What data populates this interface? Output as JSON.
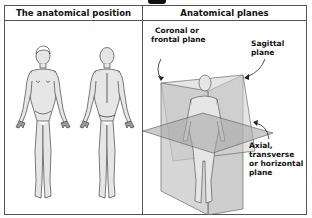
{
  "header": {
    "left": "The anatomical position",
    "right": "Anatomical planes"
  },
  "labels": {
    "coronal_line1": "Coronal or",
    "coronal_line2": "frontal plane",
    "sagittal": "Sagittal plane",
    "axial_line1": "Axial, transverse",
    "axial_line2": "or horizontal",
    "axial_line3": "plane"
  },
  "figures": {
    "left_panel": [
      "anterior-view-figure",
      "posterior-view-figure"
    ],
    "right_panel": [
      "figure-with-planes"
    ]
  },
  "colors": {
    "border": "#555555",
    "plane_fill": "#bdbdbd",
    "body_fill": "#e6e6e6",
    "line": "#444444"
  }
}
